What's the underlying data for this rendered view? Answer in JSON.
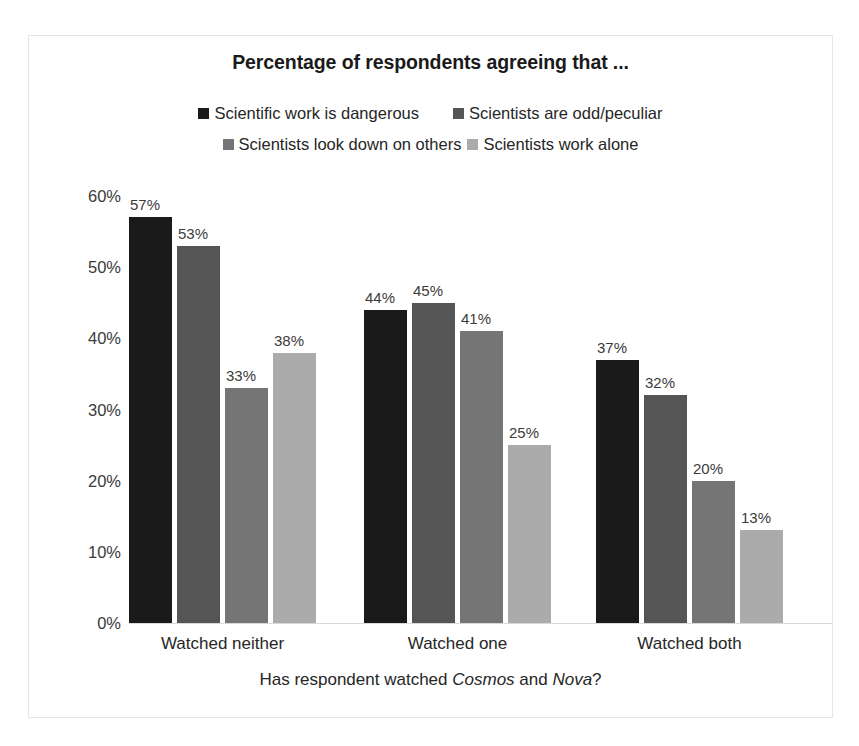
{
  "chart_data": {
    "type": "bar",
    "title": "Percentage of respondents agreeing that ...",
    "xlabel_parts": [
      {
        "text": "Has respondent watched ",
        "italic": false
      },
      {
        "text": "Cosmos",
        "italic": true
      },
      {
        "text": " and ",
        "italic": false
      },
      {
        "text": "Nova",
        "italic": true
      },
      {
        "text": "?",
        "italic": false
      }
    ],
    "xlabel": "Has respondent watched Cosmos and Nova?",
    "ylabel": "",
    "ylim": [
      0,
      60
    ],
    "ytick_labels": [
      "60%",
      "50%",
      "40%",
      "30%",
      "20%",
      "10%",
      "0%"
    ],
    "ytick_values": [
      60,
      50,
      40,
      30,
      20,
      10,
      0
    ],
    "grid": false,
    "legend_position": "top",
    "categories": [
      "Watched neither",
      "Watched one",
      "Watched both"
    ],
    "series": [
      {
        "name": "Scientific work is dangerous",
        "color": "#1a1a1a",
        "values": [
          57,
          44,
          37
        ],
        "labels": [
          "57%",
          "44%",
          "37%"
        ]
      },
      {
        "name": "Scientists are odd/peculiar",
        "color": "#555555",
        "values": [
          53,
          45,
          32
        ],
        "labels": [
          "53%",
          "45%",
          "32%"
        ]
      },
      {
        "name": "Scientists look down on others",
        "color": "#757575",
        "values": [
          33,
          41,
          20
        ],
        "labels": [
          "33%",
          "41%",
          "20%"
        ]
      },
      {
        "name": "Scientists work alone",
        "color": "#ababab",
        "values": [
          38,
          25,
          13
        ],
        "labels": [
          "38%",
          "25%",
          "13%"
        ]
      }
    ]
  }
}
